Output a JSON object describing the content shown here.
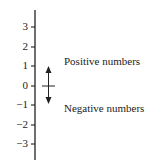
{
  "diagram": {
    "axis": {
      "ticks": [
        {
          "label": "3",
          "y": 27
        },
        {
          "label": "2",
          "y": 47
        },
        {
          "label": "1",
          "y": 66
        },
        {
          "label": "0",
          "y": 86
        },
        {
          "label": "−1",
          "y": 105
        },
        {
          "label": "−2",
          "y": 125
        },
        {
          "label": "−3",
          "y": 144
        }
      ]
    },
    "labels": {
      "positive": "Positive numbers",
      "negative": "Negative numbers"
    },
    "colors": {
      "line": "#222222",
      "text": "#222222"
    }
  }
}
